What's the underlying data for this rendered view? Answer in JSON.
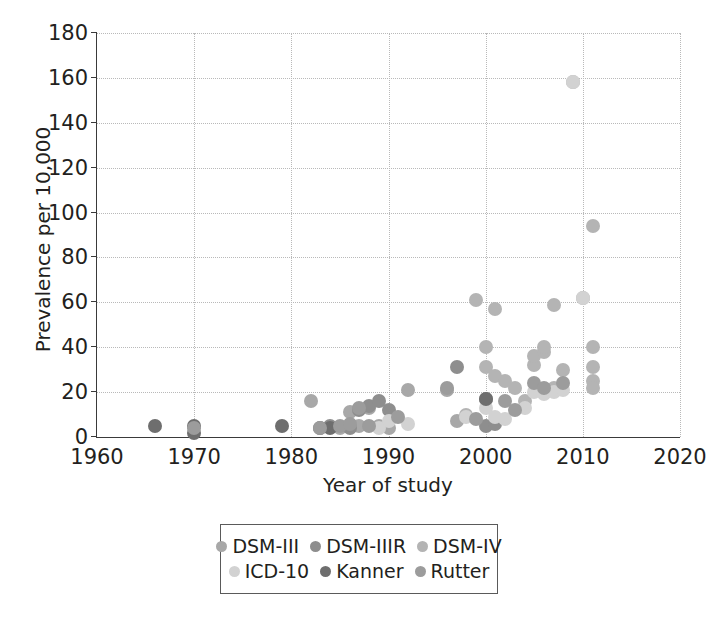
{
  "chart_data": {
    "type": "scatter",
    "title": "",
    "xlabel": "Year of study",
    "ylabel": "Prevalence per 10,000",
    "xlim": [
      1960,
      2020
    ],
    "ylim": [
      0,
      180
    ],
    "xticks": [
      1960,
      1970,
      1980,
      1990,
      2000,
      2010,
      2020
    ],
    "yticks": [
      0,
      20,
      40,
      60,
      80,
      100,
      120,
      140,
      160,
      180
    ],
    "grid": true,
    "legend_position": "below-center",
    "series": [
      {
        "name": "DSM-III",
        "color": "#a8a8a8",
        "points": [
          [
            1982,
            16
          ],
          [
            1985,
            4
          ],
          [
            1986,
            11
          ],
          [
            1987,
            5
          ],
          [
            1988,
            13
          ],
          [
            1989,
            5
          ],
          [
            1990,
            4
          ],
          [
            1992,
            21
          ],
          [
            1996,
            21
          ],
          [
            1997,
            7
          ]
        ]
      },
      {
        "name": "DSM-IIIR",
        "color": "#8e8e8e",
        "points": [
          [
            1984,
            5
          ],
          [
            1986,
            4
          ],
          [
            1987,
            12
          ],
          [
            1988,
            14
          ],
          [
            1989,
            16
          ],
          [
            1990,
            12
          ],
          [
            1997,
            31
          ],
          [
            2000,
            17
          ],
          [
            2000,
            5
          ],
          [
            2001,
            6
          ]
        ]
      },
      {
        "name": "DSM-IV",
        "color": "#b4b4b4",
        "points": [
          [
            1998,
            10
          ],
          [
            1999,
            61
          ],
          [
            2000,
            40
          ],
          [
            2000,
            31
          ],
          [
            2001,
            57
          ],
          [
            2001,
            27
          ],
          [
            2002,
            25
          ],
          [
            2003,
            22
          ],
          [
            2004,
            16
          ],
          [
            2005,
            32
          ],
          [
            2005,
            36
          ],
          [
            2006,
            38
          ],
          [
            2006,
            40
          ],
          [
            2007,
            59
          ],
          [
            2007,
            22
          ],
          [
            2008,
            30
          ],
          [
            2009,
            158
          ],
          [
            2010,
            62
          ],
          [
            2011,
            94
          ],
          [
            2011,
            40
          ],
          [
            2011,
            31
          ],
          [
            2011,
            25
          ],
          [
            2011,
            22
          ]
        ]
      },
      {
        "name": "ICD-10",
        "color": "#d2d2d2",
        "points": [
          [
            1989,
            4
          ],
          [
            1990,
            7
          ],
          [
            1992,
            6
          ],
          [
            1998,
            9
          ],
          [
            2000,
            13
          ],
          [
            2001,
            9
          ],
          [
            2002,
            8
          ],
          [
            2004,
            13
          ],
          [
            2005,
            20
          ],
          [
            2006,
            19
          ],
          [
            2007,
            20
          ],
          [
            2008,
            21
          ],
          [
            2009,
            158
          ],
          [
            2010,
            62
          ]
        ]
      },
      {
        "name": "Kanner",
        "color": "#6e6e6e",
        "points": [
          [
            1966,
            5
          ],
          [
            1970,
            5
          ],
          [
            1970,
            2
          ],
          [
            1979,
            5
          ],
          [
            1983,
            4
          ],
          [
            1984,
            4
          ],
          [
            2000,
            17
          ]
        ]
      },
      {
        "name": "Rutter",
        "color": "#9c9c9c",
        "points": [
          [
            1970,
            4
          ],
          [
            1983,
            4
          ],
          [
            1985,
            5
          ],
          [
            1986,
            6
          ],
          [
            1987,
            13
          ],
          [
            1988,
            5
          ],
          [
            1991,
            9
          ],
          [
            1996,
            22
          ],
          [
            1999,
            8
          ],
          [
            2002,
            16
          ],
          [
            2003,
            12
          ],
          [
            2005,
            24
          ],
          [
            2006,
            22
          ],
          [
            2008,
            24
          ]
        ]
      }
    ]
  },
  "axes": {
    "y_title": "Prevalence per 10,000",
    "x_title": "Year of study",
    "y_tick_labels": [
      "0",
      "20",
      "40",
      "60",
      "80",
      "100",
      "120",
      "140",
      "160",
      "180"
    ],
    "x_tick_labels": [
      "1960",
      "1970",
      "1980",
      "1990",
      "2000",
      "2010",
      "2020"
    ]
  },
  "legend": {
    "rows": [
      [
        {
          "label": "DSM-III",
          "color": "#a8a8a8"
        },
        {
          "label": "DSM-IIIR",
          "color": "#8e8e8e"
        },
        {
          "label": "DSM-IV",
          "color": "#b4b4b4"
        }
      ],
      [
        {
          "label": "ICD-10",
          "color": "#d2d2d2"
        },
        {
          "label": "Kanner",
          "color": "#6e6e6e"
        },
        {
          "label": "Rutter",
          "color": "#9c9c9c"
        }
      ]
    ]
  },
  "style": {
    "axis_color": "#3a3a3a",
    "grid_color": "#b9b9b9",
    "text_color": "#231f20",
    "background": "#ffffff"
  }
}
